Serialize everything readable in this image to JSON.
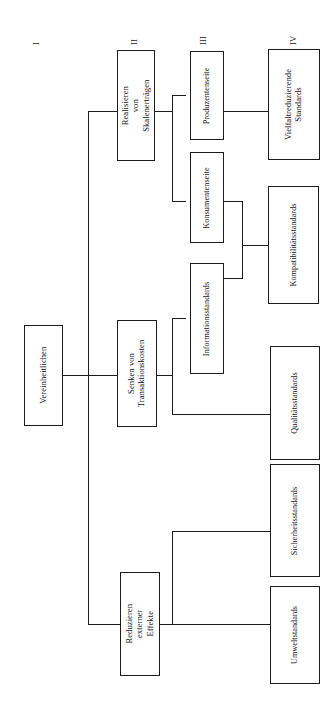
{
  "figure": {
    "orientation": "rotated-90-ccw",
    "background_color": "#ffffff",
    "line_color": "#1c1c1c",
    "text_color": "#111111"
  },
  "levels": [
    {
      "id": "I",
      "label": "I"
    },
    {
      "id": "II",
      "label": "II"
    },
    {
      "id": "III",
      "label": "III"
    },
    {
      "id": "IV",
      "label": "IV"
    }
  ],
  "nodes": {
    "root": {
      "label": "Vereinheitlichen",
      "level": "I"
    },
    "scale_returns": {
      "label": "Realisieren von\nSkalenerträgen",
      "level": "II"
    },
    "transaction_costs": {
      "label": "Senken von\nTransaktionskosten",
      "level": "II"
    },
    "external_effects": {
      "label": "Reduzieren\nexterner Effekte",
      "level": "II"
    },
    "producer_side": {
      "label": "Produzentenseite",
      "level": "III"
    },
    "consumer_side": {
      "label": "Konsumentenseite",
      "level": "III"
    },
    "information_standards": {
      "label": "Informationsstandards",
      "level": "III"
    },
    "variety_reducing": {
      "label": "Vielfaltreduzierende\nStandards",
      "level": "IV"
    },
    "compatibility": {
      "label": "Kompatibilitätsstandards",
      "level": "IV"
    },
    "quality": {
      "label": "Qualitätsstandards",
      "level": "IV"
    },
    "safety": {
      "label": "Sicherheitsstandards",
      "level": "IV"
    },
    "environment": {
      "label": "Umweltstandards",
      "level": "IV"
    }
  },
  "edges": [
    {
      "from": "root",
      "to": "scale_returns"
    },
    {
      "from": "root",
      "to": "transaction_costs"
    },
    {
      "from": "root",
      "to": "external_effects"
    },
    {
      "from": "scale_returns",
      "to": "producer_side"
    },
    {
      "from": "scale_returns",
      "to": "consumer_side"
    },
    {
      "from": "transaction_costs",
      "to": "information_standards"
    },
    {
      "from": "transaction_costs",
      "to": "quality"
    },
    {
      "from": "producer_side",
      "to": "variety_reducing"
    },
    {
      "from": "consumer_side",
      "to": "compatibility"
    },
    {
      "from": "information_standards",
      "to": "compatibility"
    },
    {
      "from": "external_effects",
      "to": "safety"
    },
    {
      "from": "external_effects",
      "to": "environment"
    }
  ]
}
